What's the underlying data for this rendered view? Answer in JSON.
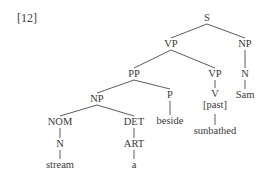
{
  "example_number": "[12]",
  "tree": {
    "nodes": [
      {
        "id": "S",
        "label": "S"
      },
      {
        "id": "VP1",
        "label": "VP"
      },
      {
        "id": "NP1",
        "label": "NP"
      },
      {
        "id": "PP",
        "label": "PP"
      },
      {
        "id": "VP2",
        "label": "VP"
      },
      {
        "id": "N1",
        "label": "N"
      },
      {
        "id": "NP2",
        "label": "NP"
      },
      {
        "id": "P",
        "label": "P"
      },
      {
        "id": "V",
        "label": "V"
      },
      {
        "id": "Sam",
        "label": "Sam"
      },
      {
        "id": "past",
        "label": "[past]"
      },
      {
        "id": "NOM",
        "label": "NOM"
      },
      {
        "id": "DET",
        "label": "DET"
      },
      {
        "id": "beside",
        "label": "beside"
      },
      {
        "id": "sunbathed",
        "label": "sunbathed"
      },
      {
        "id": "N2",
        "label": "N"
      },
      {
        "id": "ART",
        "label": "ART"
      },
      {
        "id": "stream",
        "label": "stream"
      },
      {
        "id": "a",
        "label": "a"
      }
    ],
    "edges": [
      [
        "S",
        "VP1"
      ],
      [
        "S",
        "NP1"
      ],
      [
        "VP1",
        "PP"
      ],
      [
        "VP1",
        "VP2"
      ],
      [
        "NP1",
        "N1"
      ],
      [
        "N1",
        "Sam"
      ],
      [
        "PP",
        "NP2"
      ],
      [
        "PP",
        "P"
      ],
      [
        "VP2",
        "V"
      ],
      [
        "V",
        "sunbathed"
      ],
      [
        "NP2",
        "NOM"
      ],
      [
        "NP2",
        "DET"
      ],
      [
        "P",
        "beside"
      ],
      [
        "NOM",
        "N2"
      ],
      [
        "N2",
        "stream"
      ],
      [
        "DET",
        "ART"
      ],
      [
        "ART",
        "a"
      ]
    ]
  }
}
